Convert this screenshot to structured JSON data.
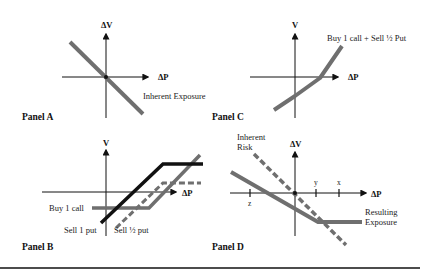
{
  "colors": {
    "axis": "#111111",
    "gray_line": "#6f6f6f",
    "black_line": "#111111",
    "rule": "#111111"
  },
  "panels": {
    "a": {
      "label": "Panel A",
      "y_axis": "ΔV",
      "x_axis": "ΔP",
      "annotation": "Inherent Exposure"
    },
    "b": {
      "label": "Panel B",
      "y_axis": "V",
      "x_axis": "ΔP",
      "annotations": {
        "buy_call": "Buy 1 call",
        "sell_put": "Sell 1 put",
        "sell_half_put": "Sell ½ put"
      }
    },
    "c": {
      "label": "Panel C",
      "y_axis": "V",
      "x_axis": "ΔP",
      "annotation": "Buy 1 call  +  Sell ½ Put"
    },
    "d": {
      "label": "Panel D",
      "y_axis": "ΔV",
      "x_axis": "ΔP",
      "ticks": [
        "z",
        "y",
        "x"
      ],
      "annotations": {
        "inherent_1": "Inherent",
        "inherent_2": "Risk",
        "resulting_1": "Resulting",
        "resulting_2": "Exposure"
      }
    }
  }
}
